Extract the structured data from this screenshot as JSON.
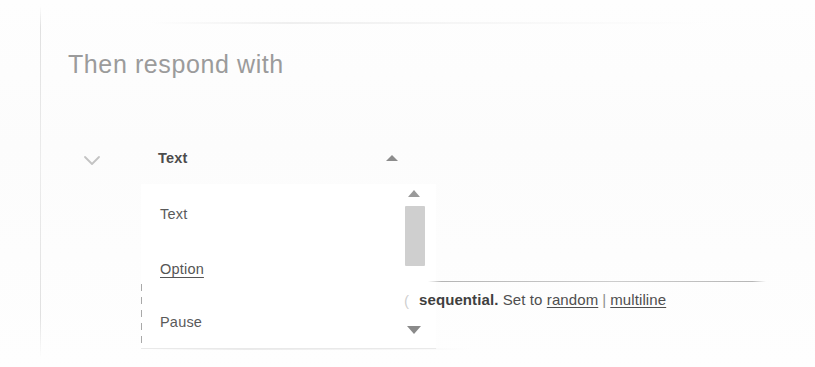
{
  "page": {
    "title": "Then respond with"
  },
  "collapse": {
    "icon": "chevron-down-icon"
  },
  "select": {
    "value": "Text",
    "caret_icon": "caret-up-icon",
    "options": [
      {
        "label": "Text",
        "state": "normal"
      },
      {
        "label": "Option",
        "state": "hovered"
      },
      {
        "label": "Pause",
        "state": "normal"
      }
    ]
  },
  "scrollbar": {
    "up_icon": "scroll-up-arrow-icon",
    "down_icon": "scroll-down-arrow-icon",
    "thumb": "scrollbar-thumb"
  },
  "helper": {
    "clipped_prefix": "(",
    "lead": "sequential.",
    "text": " Set to ",
    "link_random": "random",
    "separator": "|",
    "link_multiline": "multiline"
  },
  "colors": {
    "background": "#fefefe",
    "title": "#9b9b9b",
    "value_text": "#4c4c4c",
    "option_text": "#5a5a5a",
    "helper_text": "#4f4f4f",
    "scrollbar_thumb": "#cfcfcf",
    "rule": "#b2b2b2"
  }
}
